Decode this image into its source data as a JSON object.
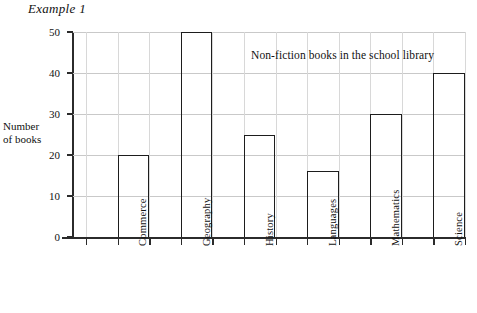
{
  "figure": {
    "example_label": "Example 1"
  },
  "chart_data": {
    "type": "bar",
    "title": "Non-fiction books in the school library",
    "xlabel": "",
    "ylabel": "Number\nof books",
    "ylabel_line1": "Number",
    "ylabel_line2": "of books",
    "categories": [
      "Commerce",
      "Geography",
      "History",
      "Languages",
      "Mathematics",
      "Science"
    ],
    "values": [
      20,
      50,
      25,
      16,
      30,
      40
    ],
    "ylim": [
      0,
      50
    ],
    "ytick_labels": [
      "0",
      "10",
      "20",
      "30",
      "40",
      "50"
    ],
    "ytick_values": [
      0,
      10,
      20,
      30,
      40,
      50
    ],
    "grid": "light grey horizontal and vertical gridlines",
    "legend": "none",
    "annotation_position": "inside plot, upper right",
    "bar_style": "open outline, black 1.7px, no fill",
    "colors": {
      "bar_outline": "#1d1d1d",
      "axis": "#2b2b2b",
      "gridline": "#c9c9c9",
      "background": "#ffffff",
      "text": "#111111"
    }
  }
}
